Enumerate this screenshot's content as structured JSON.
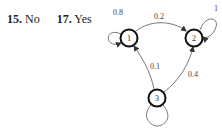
{
  "answers": [
    {
      "number": "15.",
      "value": "No"
    },
    {
      "number": "17.",
      "value": "Yes"
    }
  ],
  "diagram": {
    "type": "markov-chain",
    "nodes": [
      {
        "id": "1",
        "label": "1"
      },
      {
        "id": "2",
        "label": "2"
      },
      {
        "id": "3",
        "label": "3"
      }
    ],
    "edges": [
      {
        "from": "1",
        "to": "1",
        "label": "0.8"
      },
      {
        "from": "1",
        "to": "2",
        "label": "0.2"
      },
      {
        "from": "2",
        "to": "2",
        "label": "1"
      },
      {
        "from": "3",
        "to": "1",
        "label": "0.1"
      },
      {
        "from": "3",
        "to": "2",
        "label": "0.4"
      },
      {
        "from": "3",
        "to": "3",
        "label": ""
      }
    ]
  }
}
